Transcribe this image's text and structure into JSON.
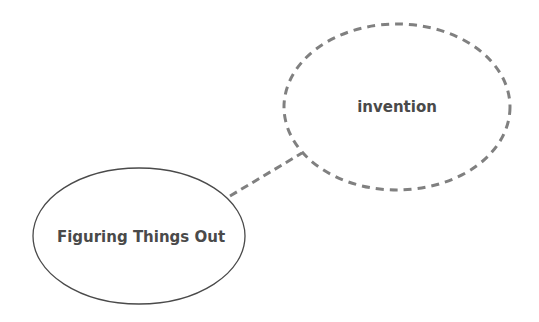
{
  "diagram": {
    "type": "concept-map",
    "nodes": [
      {
        "id": "invention",
        "label": "invention",
        "style": "dashed",
        "cx": 397,
        "cy": 107,
        "rx": 113,
        "ry": 83,
        "stroke": "#808080",
        "font_size": 15
      },
      {
        "id": "figuring",
        "label": "Figuring Things Out",
        "style": "solid",
        "cx": 139,
        "cy": 236,
        "rx": 106,
        "ry": 68,
        "stroke": "#4a4a4a",
        "font_size": 15
      }
    ],
    "edges": [
      {
        "from": "figuring",
        "to": "invention",
        "style": "dashed",
        "x1": 230,
        "y1": 196,
        "x2": 302,
        "y2": 153,
        "stroke": "#808080"
      }
    ]
  }
}
